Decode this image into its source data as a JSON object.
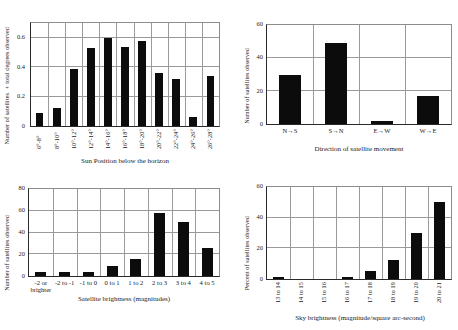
{
  "figure": {
    "layout": "2x2-grid-of-bar-charts",
    "background_color": "#ffffff",
    "bar_color": "#0c0c0c",
    "grid_color": "#9a9a9a",
    "axis_color": "#2b2b2b"
  },
  "chart_data": [
    {
      "id": "sun-position",
      "type": "bar",
      "title": "",
      "xlabel": "Sun Position below the horizon",
      "ylabel": "Number of satellites ÷ total degrees observed",
      "categories": [
        "6°-8°",
        "8°-10°",
        "10°-12°",
        "12°-14°",
        "14°-16°",
        "16°-18°",
        "18°-20°",
        "20°-22°",
        "22°-24°",
        "24°-26°",
        "26°-28°"
      ],
      "values": [
        0.09,
        0.12,
        0.39,
        0.53,
        0.6,
        0.54,
        0.58,
        0.36,
        0.32,
        0.06,
        0.34
      ],
      "ylim": [
        0,
        0.7
      ],
      "yticks": [
        0,
        0.2,
        0.4,
        0.6
      ],
      "ytick_labels": [
        "0",
        "0.2",
        "0.4",
        "0.6"
      ],
      "grid": "both",
      "legend": "none"
    },
    {
      "id": "direction-of-movement",
      "type": "bar",
      "title": "",
      "xlabel": "Direction of satellite movement",
      "ylabel": "Number of satellites observed",
      "categories": [
        "N→S",
        "S→N",
        "E→W",
        "W→E"
      ],
      "values": [
        30,
        49,
        2,
        17
      ],
      "ylim": [
        0,
        60
      ],
      "yticks": [
        0,
        20,
        40,
        60
      ],
      "ytick_labels": [
        "0",
        "20",
        "40",
        "60"
      ],
      "grid": "both",
      "legend": "none"
    },
    {
      "id": "satellite-brightness",
      "type": "bar",
      "title": "",
      "xlabel": "Satellite brightness (magnitudes)",
      "ylabel": "Number of satellites observed",
      "categories": [
        "-2 or brighter",
        "-2 to -1",
        "-1 to 0",
        "0 to 1",
        "1 to 2",
        "2 to 3",
        "3 to 4",
        "4 to 5"
      ],
      "values": [
        4,
        4,
        4,
        9,
        16,
        58,
        50,
        26
      ],
      "ylim": [
        0,
        80
      ],
      "yticks": [
        0,
        20,
        40,
        60,
        80
      ],
      "ytick_labels": [
        "0",
        "20",
        "40",
        "60",
        "80"
      ],
      "grid": "both",
      "legend": "none"
    },
    {
      "id": "sky-brightness",
      "type": "bar",
      "title": "",
      "xlabel": "Sky brightness (magnitude/square arc-second)",
      "ylabel": "Percent of satellites observed",
      "categories": [
        "13 to 14",
        "14 to 15",
        "15 to 16",
        "16 to 17",
        "17 to 18",
        "18 to 19",
        "19 to 20",
        "20 to 21"
      ],
      "values": [
        1,
        0,
        0,
        1,
        5,
        12.5,
        30,
        50
      ],
      "ylim": [
        0,
        60
      ],
      "yticks": [
        0,
        20,
        40,
        60
      ],
      "ytick_labels": [
        "0",
        "20",
        "40",
        "60"
      ],
      "grid": "both",
      "legend": "none"
    }
  ]
}
